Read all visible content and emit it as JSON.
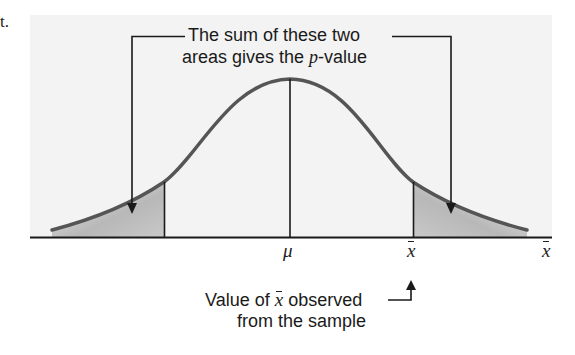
{
  "page_fragment": "t.",
  "callout_top": {
    "line1": "The sum of these two",
    "line2_prefix": "areas gives the ",
    "line2_italic": "p",
    "line2_suffix": "-value"
  },
  "axis_labels": {
    "mean": "μ",
    "observed": "x",
    "axis_variable": "x"
  },
  "callout_bottom": {
    "line1_prefix": "Value of ",
    "line1_symbol": "x",
    "line1_suffix": " observed",
    "line2": "from the sample"
  },
  "colors": {
    "panel_background": "#f3f3f3",
    "curve": "#555555",
    "shade_dark": "#a8a8a8",
    "shade_light": "#f0f0f0",
    "lines": "#1a1a1a"
  }
}
